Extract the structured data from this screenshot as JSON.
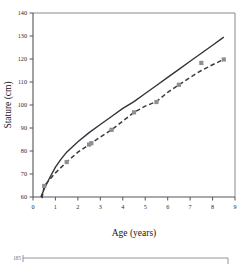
{
  "figure": {
    "name": "growth-chart-figure"
  },
  "chart_data": {
    "type": "line",
    "title": "",
    "xlabel": "Age (years)",
    "ylabel": "Stature (cm)",
    "xlim": [
      0,
      9
    ],
    "ylim": [
      60,
      140
    ],
    "xticks": [
      0,
      1,
      2,
      3,
      4,
      5,
      6,
      7,
      8,
      9
    ],
    "yticks": [
      60,
      70,
      80,
      90,
      100,
      110,
      120,
      130,
      140
    ],
    "grid": false,
    "legend": "none",
    "series": [
      {
        "name": "reference-curve",
        "style": "solid",
        "color": "#33333a",
        "x": [
          0.35,
          0.5,
          0.75,
          1.0,
          1.25,
          1.5,
          2.0,
          2.5,
          3.0,
          3.5,
          4.0,
          4.5,
          5.0,
          5.5,
          6.0,
          6.5,
          7.0,
          7.5,
          8.0,
          8.5
        ],
        "y": [
          60.0,
          63.5,
          68.5,
          73.0,
          76.5,
          79.5,
          84.0,
          88.0,
          91.5,
          95.0,
          98.5,
          101.5,
          105.0,
          108.5,
          112.0,
          115.5,
          119.0,
          122.5,
          126.0,
          129.5
        ]
      },
      {
        "name": "patient-curve",
        "style": "dashed",
        "color": "#3a3a42",
        "x": [
          0.4,
          0.5,
          1.0,
          1.5,
          2.0,
          2.5,
          3.0,
          3.5,
          4.0,
          4.5,
          5.0,
          5.5,
          6.0,
          6.5,
          7.0,
          7.5,
          8.0,
          8.5
        ],
        "y": [
          59.5,
          64.8,
          70.5,
          75.2,
          79.5,
          82.8,
          86.0,
          89.2,
          93.0,
          96.8,
          99.5,
          101.5,
          105.5,
          108.8,
          112.0,
          115.0,
          117.5,
          119.8
        ]
      }
    ],
    "points": {
      "name": "patient-measurements",
      "marker": "square",
      "color": "#8e8e94",
      "x": [
        0.5,
        1.5,
        2.5,
        2.6,
        3.5,
        4.5,
        5.5,
        6.5,
        7.5,
        8.5
      ],
      "y": [
        64.8,
        75.2,
        82.8,
        83.4,
        89.2,
        96.8,
        101.3,
        108.8,
        118.3,
        119.8
      ]
    }
  },
  "partial_figure": {
    "name": "next-figure-top-edge",
    "tick_label": "185"
  }
}
